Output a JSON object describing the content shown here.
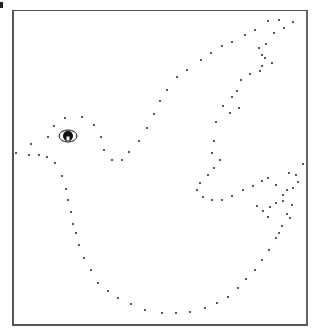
{
  "puzzle": {
    "type": "connect-the-dots",
    "subject": "dove",
    "colors": {
      "background": "#ffffff",
      "dot": "#333333",
      "frame": "#555555",
      "eye": "#111111"
    },
    "eye": {
      "cx": 68,
      "cy": 136,
      "rx": 9,
      "ry": 6
    },
    "dots": [
      [
        16,
        153
      ],
      [
        31,
        144
      ],
      [
        29,
        155
      ],
      [
        39,
        155
      ],
      [
        47,
        157
      ],
      [
        55,
        163
      ],
      [
        48,
        137
      ],
      [
        54,
        126
      ],
      [
        65,
        118
      ],
      [
        82,
        117
      ],
      [
        94,
        125
      ],
      [
        101,
        137
      ],
      [
        104,
        150
      ],
      [
        112,
        160
      ],
      [
        122,
        160
      ],
      [
        129,
        152
      ],
      [
        139,
        141
      ],
      [
        147,
        128
      ],
      [
        154,
        114
      ],
      [
        160,
        101
      ],
      [
        167,
        90
      ],
      [
        177,
        77
      ],
      [
        187,
        70
      ],
      [
        201,
        60
      ],
      [
        211,
        53
      ],
      [
        222,
        46
      ],
      [
        232,
        42
      ],
      [
        245,
        35
      ],
      [
        255,
        30
      ],
      [
        268,
        21
      ],
      [
        279,
        20
      ],
      [
        293,
        22
      ],
      [
        284,
        28
      ],
      [
        274,
        33
      ],
      [
        266,
        44
      ],
      [
        259,
        48
      ],
      [
        262,
        55
      ],
      [
        265,
        58
      ],
      [
        272,
        63
      ],
      [
        262,
        66
      ],
      [
        260,
        71
      ],
      [
        250,
        74
      ],
      [
        241,
        80
      ],
      [
        237,
        91
      ],
      [
        232,
        97
      ],
      [
        239,
        108
      ],
      [
        230,
        113
      ],
      [
        223,
        106
      ],
      [
        216,
        122
      ],
      [
        214,
        141
      ],
      [
        212,
        153
      ],
      [
        220,
        160
      ],
      [
        214,
        168
      ],
      [
        208,
        175
      ],
      [
        200,
        183
      ],
      [
        197,
        190
      ],
      [
        203,
        197
      ],
      [
        212,
        200
      ],
      [
        222,
        200
      ],
      [
        232,
        196
      ],
      [
        243,
        190
      ],
      [
        253,
        186
      ],
      [
        262,
        181
      ],
      [
        268,
        178
      ],
      [
        276,
        185
      ],
      [
        289,
        173
      ],
      [
        296,
        175
      ],
      [
        303,
        164
      ],
      [
        298,
        182
      ],
      [
        293,
        188
      ],
      [
        287,
        190
      ],
      [
        283,
        195
      ],
      [
        283,
        201
      ],
      [
        276,
        203
      ],
      [
        270,
        207
      ],
      [
        263,
        211
      ],
      [
        257,
        206
      ],
      [
        268,
        217
      ],
      [
        290,
        218
      ],
      [
        279,
        233
      ],
      [
        292,
        205
      ],
      [
        62,
        176
      ],
      [
        66,
        189
      ],
      [
        68,
        200
      ],
      [
        71,
        212
      ],
      [
        73,
        224
      ],
      [
        76,
        233
      ],
      [
        79,
        245
      ],
      [
        84,
        258
      ],
      [
        91,
        270
      ],
      [
        98,
        283
      ],
      [
        108,
        291
      ],
      [
        118,
        298
      ],
      [
        131,
        304
      ],
      [
        145,
        310
      ],
      [
        162,
        313
      ],
      [
        176,
        313
      ],
      [
        190,
        312
      ],
      [
        205,
        308
      ],
      [
        217,
        303
      ],
      [
        228,
        297
      ],
      [
        238,
        288
      ],
      [
        246,
        279
      ],
      [
        255,
        270
      ],
      [
        262,
        260
      ],
      [
        269,
        250
      ],
      [
        276,
        238
      ],
      [
        282,
        226
      ],
      [
        287,
        214
      ]
    ]
  }
}
